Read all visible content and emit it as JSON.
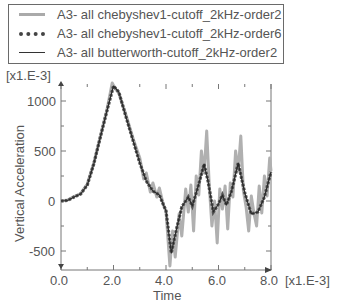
{
  "legend": {
    "items": [
      {
        "label": "A3- all chebyshev1-cutoff_2kHz-order2",
        "style": "solid-thick-lightgray"
      },
      {
        "label": "A3- all chebyshev1-cutoff_2kHz-order6",
        "style": "dotted-dark"
      },
      {
        "label": "A3- all butterworth-cutoff_2kHz-order2",
        "style": "solid-thin-dark"
      }
    ]
  },
  "axes": {
    "y_multiplier": "[x1.E-3]",
    "x_multiplier": "[x1.E-3]",
    "ylabel": "Vertical Acceleration",
    "xlabel": "Time",
    "y_ticks": [
      "1000",
      "500",
      "0",
      "-500"
    ],
    "x_ticks": [
      "0.0",
      "2.0",
      "4.0",
      "6.0",
      "8.0"
    ]
  },
  "chart_data": {
    "type": "line",
    "title": "",
    "xlabel": "Time [x1.E-3]",
    "ylabel": "Vertical Acceleration [x1.E-3]",
    "xlim": [
      0,
      8
    ],
    "ylim": [
      -690,
      1170
    ],
    "grid": false,
    "legend_position": "top (above plot)",
    "x_ticks": [
      0,
      2,
      4,
      6,
      8
    ],
    "y_ticks": [
      -500,
      0,
      500,
      1000
    ],
    "series": [
      {
        "name": "A3- all chebyshev1-cutoff_2kHz-order2",
        "color": "#aaaaaa",
        "x": [
          0,
          0.25,
          0.5,
          0.75,
          1.0,
          1.25,
          1.5,
          1.75,
          1.95,
          2.05,
          2.2,
          2.5,
          2.75,
          3.0,
          3.15,
          3.25,
          3.4,
          3.5,
          3.65,
          3.75,
          3.9,
          4.0,
          4.15,
          4.25,
          4.35,
          4.5,
          4.6,
          4.75,
          4.85,
          4.95,
          5.05,
          5.15,
          5.25,
          5.35,
          5.45,
          5.55,
          5.65,
          5.75,
          5.85,
          5.95,
          6.05,
          6.15,
          6.25,
          6.35,
          6.45,
          6.55,
          6.65,
          6.75,
          6.85,
          6.95,
          7.05,
          7.15,
          7.25,
          7.35,
          7.45,
          7.55,
          7.65,
          7.75,
          7.85,
          7.95,
          8.0
        ],
        "values": [
          0,
          10,
          45,
          75,
          170,
          380,
          650,
          910,
          1180,
          1130,
          1080,
          840,
          620,
          430,
          220,
          280,
          90,
          180,
          40,
          130,
          -40,
          -100,
          -650,
          -300,
          -560,
          -130,
          -350,
          120,
          -110,
          160,
          -300,
          250,
          60,
          500,
          280,
          700,
          150,
          -250,
          0,
          -420,
          120,
          -80,
          150,
          -280,
          180,
          40,
          500,
          300,
          650,
          100,
          -60,
          -300,
          50,
          -120,
          -250,
          150,
          -120,
          250,
          50,
          430,
          300
        ]
      },
      {
        "name": "A3- all chebyshev1-cutoff_2kHz-order6",
        "color": "#444444",
        "x": [
          0,
          0.25,
          0.5,
          0.75,
          1.0,
          1.25,
          1.5,
          1.75,
          2.0,
          2.2,
          2.5,
          2.75,
          3.0,
          3.25,
          3.5,
          3.75,
          4.0,
          4.2,
          4.4,
          4.6,
          4.85,
          5.0,
          5.25,
          5.45,
          5.6,
          5.8,
          6.0,
          6.15,
          6.3,
          6.5,
          6.75,
          7.0,
          7.25,
          7.5,
          7.75,
          8.0
        ],
        "values": [
          0,
          5,
          40,
          70,
          160,
          370,
          640,
          900,
          1150,
          1090,
          820,
          600,
          380,
          200,
          100,
          60,
          -100,
          -520,
          -280,
          -60,
          40,
          -50,
          170,
          370,
          200,
          -110,
          -30,
          60,
          -40,
          100,
          380,
          80,
          -130,
          -110,
          40,
          290
        ]
      },
      {
        "name": "A3- all butterworth-cutoff_2kHz-order2",
        "color": "#333333",
        "x": [
          0,
          0.25,
          0.5,
          0.75,
          1.0,
          1.25,
          1.5,
          1.75,
          2.0,
          2.2,
          2.5,
          2.75,
          3.0,
          3.25,
          3.5,
          3.75,
          4.0,
          4.2,
          4.4,
          4.6,
          4.85,
          5.0,
          5.25,
          5.45,
          5.6,
          5.8,
          6.0,
          6.15,
          6.3,
          6.5,
          6.75,
          7.0,
          7.25,
          7.5,
          7.75,
          8.0
        ],
        "values": [
          0,
          5,
          40,
          70,
          160,
          370,
          640,
          900,
          1150,
          1090,
          820,
          600,
          380,
          200,
          100,
          60,
          -100,
          -520,
          -280,
          -60,
          40,
          -50,
          170,
          370,
          200,
          -110,
          -30,
          60,
          -40,
          100,
          380,
          80,
          -130,
          -110,
          40,
          290
        ]
      }
    ]
  }
}
